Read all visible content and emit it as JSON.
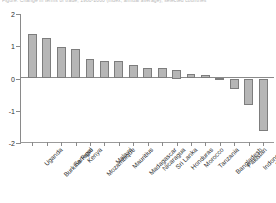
{
  "figure": {
    "title_clipped": "Figure: Change in terms of trade, 1980-2000 (index, annual average), selected countries"
  },
  "chart_data": {
    "type": "bar",
    "title": "",
    "xlabel": "",
    "ylabel": "",
    "ylim": [
      -2,
      2
    ],
    "yticks": [
      2,
      1,
      0,
      -1,
      -2
    ],
    "ytick_labels": [
      "2",
      "1",
      "0",
      "-1",
      "-2"
    ],
    "grid": false,
    "legend": "none",
    "orientation": "vertical",
    "bar_fill": "#b6b6b6",
    "bar_edge": "#7d7d7d",
    "zero_line": 0,
    "categories": [
      "Uganda",
      "Burkina Faso",
      "Senegal",
      "Kenya",
      "Mozambique",
      "Malawi",
      "Mauritius",
      "Madagascar",
      "Nicaragua",
      "Sri Lanka",
      "Honduras",
      "Morocco",
      "Tanzania",
      "Bangladesh",
      "Pakistan",
      "Indonesia",
      "Ethiopia"
    ],
    "values": [
      1.38,
      1.27,
      0.98,
      0.93,
      0.62,
      0.55,
      0.55,
      0.42,
      0.34,
      0.33,
      0.25,
      0.14,
      0.1,
      0.02,
      -0.34,
      -0.81,
      -1.62
    ]
  }
}
